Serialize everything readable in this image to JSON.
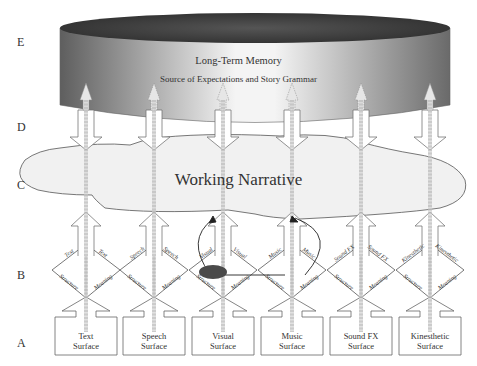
{
  "row_labels": [
    "E",
    "D",
    "C",
    "B",
    "A"
  ],
  "long_term_memory": {
    "title": "Long-Term Memory",
    "subtitle": "Source of Expectations and Story Grammar"
  },
  "working_narrative": {
    "title": "Working Narrative"
  },
  "modalities": [
    {
      "name": "Text",
      "surface_line1": "Text",
      "surface_line2": "Surface",
      "structure": "Structure",
      "meaning": "Meaning",
      "left_top": "Text",
      "right_top": "Text"
    },
    {
      "name": "Speech",
      "surface_line1": "Speech",
      "surface_line2": "Surface",
      "structure": "Structure",
      "meaning": "Meaning",
      "left_top": "Speech",
      "right_top": "Speech"
    },
    {
      "name": "Visual",
      "surface_line1": "Visual",
      "surface_line2": "Surface",
      "structure": "Structure",
      "meaning": "Meaning",
      "left_top": "Visual",
      "right_top": "Visual"
    },
    {
      "name": "Music",
      "surface_line1": "Music",
      "surface_line2": "Surface",
      "structure": "Structure",
      "meaning": "Meaning",
      "left_top": "Music",
      "right_top": "Music"
    },
    {
      "name": "Sound FX",
      "surface_line1": "Sound FX",
      "surface_line2": "Surface",
      "structure": "Structure",
      "meaning": "Meaning",
      "left_top": "Sound FX",
      "right_top": "Sound FX"
    },
    {
      "name": "Kinesthetic",
      "surface_line1": "Kinesthetic",
      "surface_line2": "Surface",
      "structure": "Structure",
      "meaning": "Meaning",
      "left_top": "Kinesthetic",
      "right_top": "Kinesthetic"
    }
  ],
  "colors": {
    "cylinder_top": "#3a3a3a",
    "cylinder_side_dark": "#6e6e6e",
    "cylinder_side_light": "#f2f2f2",
    "cloud": "#f2f2f2",
    "ellipse": "#4a4a4a",
    "stroke": "#555555"
  }
}
